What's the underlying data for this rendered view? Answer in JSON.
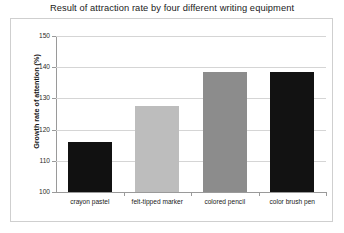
{
  "chart_data": {
    "type": "bar",
    "title": "Result of attraction rate by four different writing equipment",
    "xlabel": "",
    "ylabel": "Growth rate of attention (%)",
    "categories": [
      "crayon pastel",
      "felt-tipped marker",
      "colored pencil",
      "color brush pen"
    ],
    "values": [
      116,
      127.5,
      138.5,
      138.5
    ],
    "ylim": [
      100,
      150
    ],
    "yticks": [
      100,
      110,
      120,
      130,
      140,
      150
    ],
    "ytick_labels": [
      "100",
      "110",
      "120",
      "130",
      "140",
      "150"
    ],
    "grid": "horizontal",
    "legend": "none",
    "bar_colors": [
      "#111111",
      "#bdbdbd",
      "#8c8c8c",
      "#121212"
    ]
  },
  "figure": {
    "background_color": "#ffffff",
    "frame_color": "#cfcfcf",
    "gridline_color": "#d5d5d5",
    "axis_color": "#9a9a9a",
    "title_color": "#1a1a1a"
  }
}
